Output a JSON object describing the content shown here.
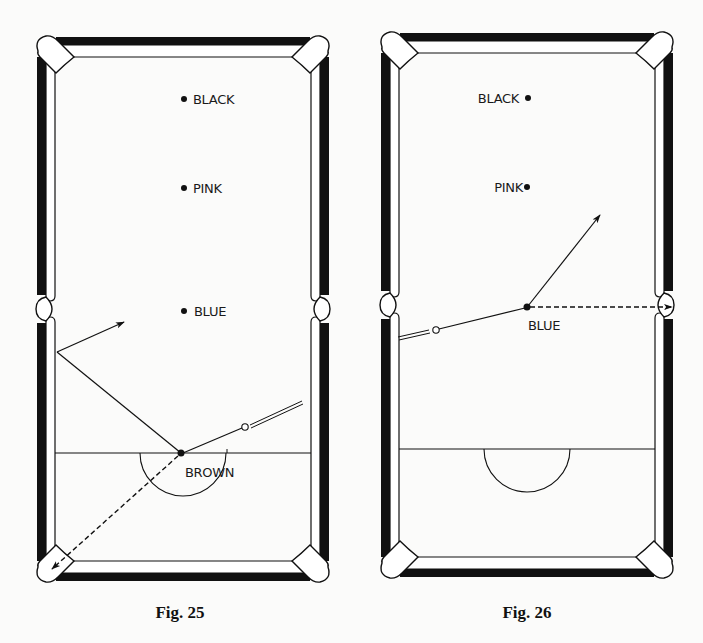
{
  "figures": [
    {
      "id": "fig25",
      "caption": "Fig. 25",
      "balls": [
        {
          "name": "black",
          "label": "BLACK",
          "x": 184,
          "y": 99,
          "label_side": "right"
        },
        {
          "name": "pink",
          "label": "PINK",
          "x": 184,
          "y": 188,
          "label_side": "right"
        },
        {
          "name": "blue",
          "label": "BLUE",
          "x": 184,
          "y": 311,
          "label_side": "right"
        },
        {
          "name": "brown",
          "label": "BROWN",
          "x": 181,
          "y": 453,
          "label_side": "below"
        }
      ],
      "annotations": {
        "cue_ball_path": "cue ball from right side travels to brown, then deflects toward left cushion and off at an angle",
        "object_ball_path": "brown potted into bottom-left corner pocket (dashed)"
      }
    },
    {
      "id": "fig26",
      "caption": "Fig. 26",
      "balls": [
        {
          "name": "black",
          "label": "BLACK",
          "x": 528,
          "y": 98,
          "label_side": "left"
        },
        {
          "name": "pink",
          "label": "PINK",
          "x": 527,
          "y": 187,
          "label_side": "left"
        },
        {
          "name": "blue",
          "label": "BLUE",
          "x": 527,
          "y": 307,
          "label_side": "below"
        }
      ],
      "annotations": {
        "cue_ball_path": "cue ball from left side hits blue, deflects upward-right",
        "object_ball_path": "blue potted into right middle pocket (dashed)"
      }
    }
  ],
  "colors": {
    "ink": "#111111",
    "paper": "#fbfbfa",
    "cushion_fill": "#ffffff"
  }
}
